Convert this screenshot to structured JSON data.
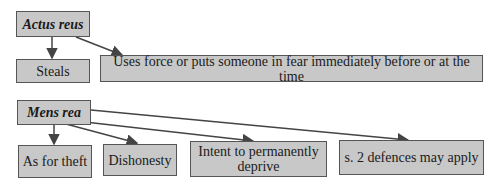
{
  "diagram": {
    "actus_reus": {
      "label": "Actus reus",
      "children": [
        {
          "label": "Steals"
        },
        {
          "label": "Uses force or puts someone in fear immediately before or at the time"
        }
      ]
    },
    "mens_rea": {
      "label": "Mens rea",
      "children": [
        {
          "label": "As for theft"
        },
        {
          "label": "Dishonesty"
        },
        {
          "label": "Intent to permanently deprive"
        },
        {
          "label": "s. 2 defences may apply"
        }
      ]
    },
    "colors": {
      "box_fill": "#c8c8c8",
      "border": "#555555",
      "arrow": "#444444"
    }
  }
}
